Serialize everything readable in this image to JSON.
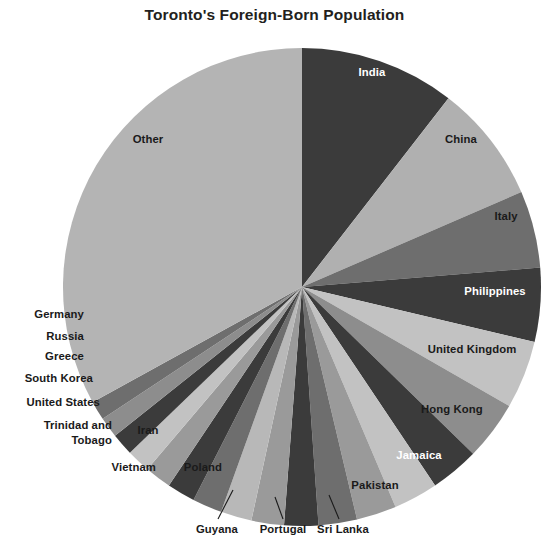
{
  "chart": {
    "title": "Toronto's Foreign-Born Population"
  },
  "chart_data": {
    "type": "pie",
    "title": "Toronto's Foreign-Born Population",
    "xlabel": "",
    "ylabel": "",
    "legend": "none",
    "grid": false,
    "start_angle_deg": 0,
    "direction": "clockwise",
    "units": "percent of foreign-born population",
    "categories": [
      "India",
      "China",
      "Italy",
      "Philippines",
      "United Kingdom",
      "Hong Kong",
      "Jamaica",
      "Pakistan",
      "Sri Lanka",
      "Portugal",
      "Guyana",
      "Vietnam",
      "Poland",
      "Iran",
      "Trinidad and Tobago",
      "United States",
      "South Korea",
      "Greece",
      "Russia",
      "Germany",
      "Other"
    ],
    "values": [
      10.5,
      8.0,
      5.2,
      5.0,
      4.6,
      4.0,
      3.3,
      3.0,
      2.7,
      2.6,
      2.3,
      2.2,
      2.1,
      2.0,
      1.9,
      1.8,
      1.6,
      1.5,
      1.4,
      1.3,
      33.0
    ],
    "colors": [
      "#3b3b3b",
      "#b0b0b0",
      "#6e6e6e",
      "#3b3b3b",
      "#c2c2c2",
      "#8d8d8d",
      "#3b3b3b",
      "#c2c2c2",
      "#9a9a9a",
      "#6e6e6e",
      "#3b3b3b",
      "#9a9a9a",
      "#b8b8b8",
      "#6e6e6e",
      "#3b3b3b",
      "#9a9a9a",
      "#c2c2c2",
      "#3b3b3b",
      "#8d8d8d",
      "#6e6e6e",
      "#b4b4b4"
    ]
  },
  "labels": {
    "inside": [
      {
        "name": "India",
        "text": "India",
        "tone": "dark",
        "x": 372,
        "y": 76,
        "anchor": "middle"
      },
      {
        "name": "China",
        "text": "China",
        "tone": "light",
        "x": 461,
        "y": 143,
        "anchor": "middle"
      },
      {
        "name": "Italy",
        "text": "Italy",
        "tone": "light",
        "x": 506,
        "y": 220,
        "anchor": "middle"
      },
      {
        "name": "Philippines",
        "text": "Philippines",
        "tone": "dark",
        "x": 495,
        "y": 295,
        "anchor": "middle"
      },
      {
        "name": "United Kingdom",
        "text": "United Kingdom",
        "tone": "light",
        "x": 472,
        "y": 353,
        "anchor": "middle"
      },
      {
        "name": "Hong Kong",
        "text": "Hong Kong",
        "tone": "light",
        "x": 452,
        "y": 413,
        "anchor": "middle"
      },
      {
        "name": "Jamaica",
        "text": "Jamaica",
        "tone": "dark",
        "x": 419,
        "y": 459,
        "anchor": "middle"
      },
      {
        "name": "Pakistan",
        "text": "Pakistan",
        "tone": "light",
        "x": 375,
        "y": 489,
        "anchor": "middle"
      },
      {
        "name": "Poland",
        "text": "Poland",
        "tone": "light",
        "x": 203,
        "y": 471,
        "anchor": "middle"
      },
      {
        "name": "Iran",
        "text": "Iran",
        "tone": "light",
        "x": 148,
        "y": 434,
        "anchor": "middle"
      },
      {
        "name": "Other",
        "text": "Other",
        "tone": "light",
        "x": 148,
        "y": 143,
        "anchor": "middle"
      }
    ],
    "outside_left": [
      {
        "name": "Germany",
        "text": "Germany",
        "x": 84,
        "y": 318
      },
      {
        "name": "Russia",
        "text": "Russia",
        "x": 84,
        "y": 340
      },
      {
        "name": "Greece",
        "text": "Greece",
        "x": 84,
        "y": 360
      },
      {
        "name": "South Korea",
        "text": "South Korea",
        "x": 93,
        "y": 382
      },
      {
        "name": "United States",
        "text": "United States",
        "x": 100,
        "y": 406
      },
      {
        "name": "Trinidad and",
        "text": "Trinidad and",
        "x": 112,
        "y": 429
      },
      {
        "name": "Tobago",
        "text": "Tobago",
        "x": 112,
        "y": 444
      },
      {
        "name": "Vietnam",
        "text": "Vietnam",
        "x": 156,
        "y": 471
      }
    ],
    "outside_bottom": [
      {
        "name": "Guyana",
        "text": "Guyana",
        "x": 217,
        "y": 533,
        "lx1": 218,
        "ly1": 519,
        "lx2": 233,
        "ly2": 490
      },
      {
        "name": "Portugal",
        "text": "Portugal",
        "x": 283,
        "y": 533,
        "lx1": 283,
        "ly1": 519,
        "lx2": 275,
        "ly2": 497
      },
      {
        "name": "Sri Lanka",
        "text": "Sri Lanka",
        "x": 343,
        "y": 533,
        "lx1": 339,
        "ly1": 519,
        "lx2": 329,
        "ly2": 495
      }
    ]
  },
  "geometry": {
    "cx": 302,
    "cy": 287,
    "r": 239
  }
}
